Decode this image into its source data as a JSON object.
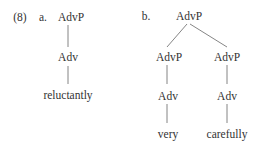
{
  "example_number": "(8)",
  "tree_a": {
    "label": "a.",
    "root": "AdvP",
    "child": "Adv",
    "leaf": "reluctantly"
  },
  "tree_b": {
    "label": "b.",
    "root": "AdvP",
    "left": {
      "phrase": "AdvP",
      "head": "Adv",
      "leaf": "very"
    },
    "right": {
      "phrase": "AdvP",
      "head": "Adv",
      "leaf": "carefully"
    }
  },
  "colors": {
    "text": "#333333",
    "lines": "#555555"
  }
}
